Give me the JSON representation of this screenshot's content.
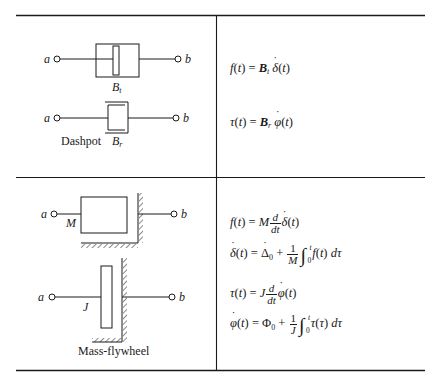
{
  "table": {
    "rows": [
      {
        "element": "Dashpot",
        "diagrams": [
          {
            "kind": "translational-damper",
            "terminal_a": "a",
            "terminal_b": "b",
            "coefficient_label": "B",
            "coefficient_subscript": "t"
          },
          {
            "kind": "rotational-damper",
            "terminal_a": "a",
            "terminal_b": "b",
            "coefficient_label": "B",
            "coefficient_subscript": "r",
            "caption": "Dashpot"
          }
        ],
        "equations": [
          {
            "text": "f(t) = B_t δ̇(t)"
          },
          {
            "text": "τ(t) = B_r φ̇(t)"
          }
        ]
      },
      {
        "element": "Mass-flywheel",
        "diagrams": [
          {
            "kind": "mass",
            "terminal_a": "a",
            "terminal_b": "b",
            "label": "M"
          },
          {
            "kind": "flywheel",
            "terminal_a": "a",
            "terminal_b": "b",
            "label": "J",
            "caption": "Mass-flywheel"
          }
        ],
        "equations": [
          {
            "text": "f(t) = M (d/dt) δ̇(t)"
          },
          {
            "text": "δ̇(t) = Δ̇₀ + (1/M) ∫₀ᵗ f(t) dτ"
          },
          {
            "text": "τ(t) = J (d/dt) φ̇(t)"
          },
          {
            "text": "φ̇(t) = Φ₀ + (1/J) ∫₀ᵗ τ(τ) dτ"
          }
        ]
      }
    ]
  },
  "labels": {
    "a": "a",
    "b": "b",
    "B": "B",
    "t": "t",
    "r": "r",
    "M": "M",
    "J": "J",
    "dashpot": "Dashpot",
    "mass_flywheel": "Mass-flywheel"
  },
  "eq": {
    "f": "f",
    "t": "t",
    "tau": "τ",
    "delta": "δ",
    "phi": "φ",
    "Delta": "Δ",
    "Phi": "Φ",
    "B": "B",
    "M": "M",
    "J": "J",
    "d": "d",
    "dt": "dt",
    "one": "1",
    "zero": "0",
    "equals": " = ",
    "plus": " + ",
    "integral": "∫",
    "lparen": "(",
    "rparen": ")",
    "dtau": "dτ"
  },
  "colors": {
    "ink": "#1a1a1a",
    "background": "#ffffff"
  }
}
